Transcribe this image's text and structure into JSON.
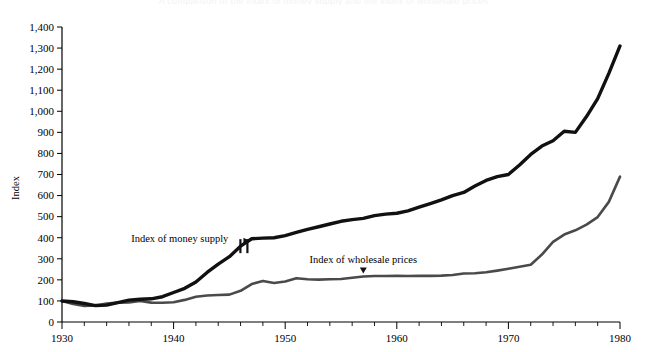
{
  "figure": {
    "top_caption": "A comparison of the index of money supply and the index of wholesale prices",
    "background": "#ffffff"
  },
  "chart_data": {
    "type": "line",
    "title": "",
    "xlabel": "",
    "ylabel": "Index",
    "xlim": [
      1930,
      1980
    ],
    "ylim": [
      0,
      1400
    ],
    "ytick_step": 100,
    "xtick_step": 10,
    "x_minor_step": 2,
    "grid": false,
    "legend": "inline-annotations",
    "ytick_labels": [
      "0",
      "100",
      "200",
      "300",
      "400",
      "500",
      "600",
      "700",
      "800",
      "900",
      "1,000",
      "1,100",
      "1,200",
      "1,300",
      "1,400"
    ],
    "ytick_values": [
      0,
      100,
      200,
      300,
      400,
      500,
      600,
      700,
      800,
      900,
      1000,
      1100,
      1200,
      1300,
      1400
    ],
    "xtick_labels": [
      "1930",
      "1940",
      "1950",
      "1960",
      "1970",
      "1980"
    ],
    "xtick_values": [
      1930,
      1940,
      1950,
      1960,
      1970,
      1980
    ],
    "annotations": [
      {
        "name": "money-supply-label",
        "text": "Index of money supply",
        "x": 1936.2,
        "y": 378,
        "pointer": "right"
      },
      {
        "name": "wholesale-prices-label",
        "text": "Index of wholesale prices",
        "x": 1957.0,
        "y": 278,
        "pointer": "down"
      },
      {
        "name": "series-break-marker",
        "text": "",
        "x": 1946.3,
        "y": 400,
        "pointer": "break"
      }
    ],
    "series": [
      {
        "name": "Index of money supply",
        "color": "#111111",
        "width": 3.4,
        "break_at_x": 1946.3,
        "x": [
          1930,
          1931,
          1932,
          1933,
          1934,
          1935,
          1936,
          1937,
          1938,
          1939,
          1940,
          1941,
          1942,
          1943,
          1944,
          1945,
          1946,
          1947,
          1948,
          1949,
          1950,
          1951,
          1952,
          1953,
          1954,
          1955,
          1956,
          1957,
          1958,
          1959,
          1960,
          1961,
          1962,
          1963,
          1964,
          1965,
          1966,
          1967,
          1968,
          1969,
          1970,
          1971,
          1972,
          1973,
          1974,
          1975,
          1976,
          1977,
          1978,
          1979,
          1980
        ],
        "values": [
          100,
          96,
          88,
          78,
          80,
          92,
          104,
          108,
          110,
          120,
          140,
          160,
          190,
          235,
          275,
          310,
          360,
          395,
          398,
          400,
          410,
          425,
          440,
          452,
          465,
          478,
          486,
          492,
          505,
          512,
          516,
          527,
          545,
          562,
          580,
          600,
          615,
          645,
          672,
          690,
          700,
          745,
          795,
          835,
          860,
          905,
          900,
          975,
          1060,
          1180,
          1310
        ]
      },
      {
        "name": "Index of wholesale prices",
        "color": "#4a4a4a",
        "width": 2.6,
        "x": [
          1930,
          1931,
          1932,
          1933,
          1934,
          1935,
          1936,
          1937,
          1938,
          1939,
          1940,
          1941,
          1942,
          1943,
          1944,
          1945,
          1946,
          1947,
          1948,
          1949,
          1950,
          1951,
          1952,
          1953,
          1954,
          1955,
          1956,
          1957,
          1958,
          1959,
          1960,
          1961,
          1962,
          1963,
          1964,
          1965,
          1966,
          1967,
          1968,
          1969,
          1970,
          1971,
          1972,
          1973,
          1974,
          1975,
          1976,
          1977,
          1978,
          1979,
          1980
        ],
        "values": [
          100,
          85,
          76,
          78,
          88,
          92,
          93,
          100,
          92,
          91,
          94,
          105,
          120,
          126,
          128,
          130,
          148,
          180,
          195,
          185,
          192,
          208,
          203,
          201,
          203,
          204,
          210,
          216,
          218,
          218,
          219,
          218,
          219,
          219,
          220,
          223,
          230,
          231,
          236,
          244,
          253,
          262,
          272,
          320,
          380,
          415,
          435,
          462,
          498,
          570,
          690
        ]
      }
    ]
  },
  "axes": {
    "y_axis_title": "Index"
  }
}
